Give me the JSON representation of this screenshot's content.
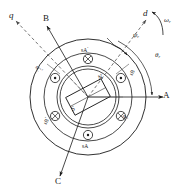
{
  "figure": {
    "kind": "pmsm-cross-section",
    "stroke_color": "#1a1a1a",
    "dash_color": "#5a5a5a",
    "background": "#ffffff"
  },
  "axes": [
    {
      "id": "A",
      "label": "A",
      "style": "solid",
      "angle_deg": 0
    },
    {
      "id": "B",
      "label": "B",
      "style": "solid",
      "angle_deg": 120
    },
    {
      "id": "C",
      "label": "C",
      "style": "solid",
      "angle_deg": 240
    },
    {
      "id": "d",
      "label": "d",
      "style": "dashed",
      "angle_deg": 62
    },
    {
      "id": "q",
      "label": "q",
      "style": "dashed",
      "angle_deg": 152
    }
  ],
  "angles": {
    "theta_r": "θ",
    "theta_r_sub": "r",
    "psi_r": "ψ",
    "psi_r_sub": "r",
    "omega_r": "ω",
    "omega_r_sub": "r"
  },
  "coils": [
    {
      "id": "sA-prime",
      "label": "sA",
      "prime": "′",
      "current": "into-page",
      "glyph": "⊗",
      "position": "top"
    },
    {
      "id": "sB",
      "label": "sB",
      "prime": "",
      "current": "out-of-page",
      "glyph": "⊙",
      "position": "upper-right"
    },
    {
      "id": "sC",
      "label": "sC",
      "prime": "",
      "current": "into-page",
      "glyph": "⊗",
      "position": "lower-right"
    },
    {
      "id": "sA",
      "label": "sA",
      "prime": "",
      "current": "out-of-page",
      "glyph": "⊙",
      "position": "bottom"
    },
    {
      "id": "sB-prime",
      "label": "sB",
      "prime": "′",
      "current": "into-page",
      "glyph": "⊗",
      "position": "lower-left"
    },
    {
      "id": "sC-prime",
      "label": "sC",
      "prime": "′",
      "current": "out-of-page",
      "glyph": "⊙",
      "position": "upper-left"
    }
  ],
  "rotor": {
    "north_label": "N",
    "south_label": "S",
    "magnet_tilt_deg": -28
  }
}
